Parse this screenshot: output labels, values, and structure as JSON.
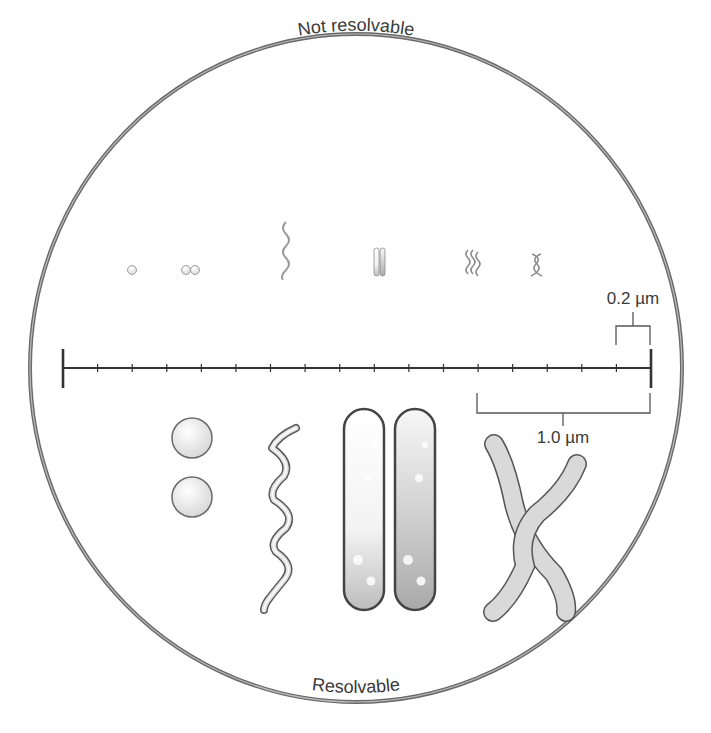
{
  "diagram": {
    "title_top": "Not resolvable",
    "title_bottom": "Resolvable",
    "scale": {
      "label_small": "0.2 µm",
      "label_large": "1.0 µm",
      "tick_count": 17,
      "units_per_tick_um": 0.2
    },
    "organisms_small": [
      {
        "name": "coccus",
        "shape": "single sphere"
      },
      {
        "name": "diplococcus",
        "shape": "paired spheres"
      },
      {
        "name": "spirochete",
        "shape": "thin spiral"
      },
      {
        "name": "bacillus-pair",
        "shape": "paired rods"
      },
      {
        "name": "spirilla-group",
        "shape": "wavy rods"
      },
      {
        "name": "twisted-filaments",
        "shape": "crossed curved rods"
      }
    ],
    "organisms_large": [
      {
        "name": "diplococcus",
        "shape": "two spheres"
      },
      {
        "name": "spirochete",
        "shape": "spiral"
      },
      {
        "name": "bacillus-pair",
        "shape": "two rods"
      },
      {
        "name": "curved-rods",
        "shape": "crossed curved rods"
      }
    ],
    "colors": {
      "outline": "#555555",
      "fill_light": "#f0f0f0",
      "fill_mid": "#d9d9d9",
      "fill_dark": "#bdbdbd",
      "text": "#3a3a3a"
    }
  }
}
